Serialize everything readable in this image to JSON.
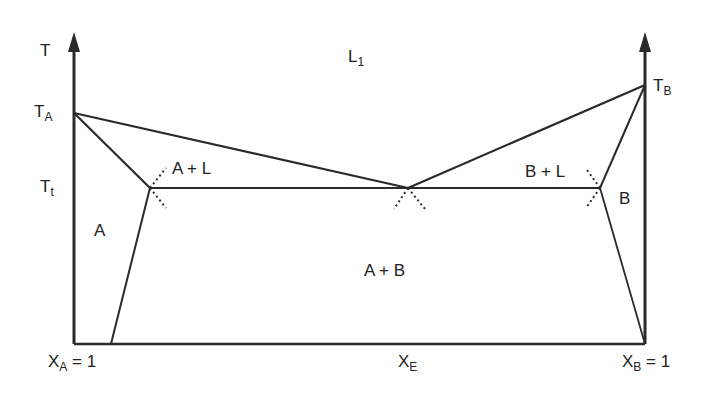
{
  "diagram": {
    "type": "binary eutectic phase diagram",
    "axis": {
      "y_label": "T",
      "x_left_label": "X",
      "x_left_sub": "A",
      "x_left_suffix": " = 1",
      "x_mid_label": "X",
      "x_mid_sub": "E",
      "x_right_label": "X",
      "x_right_sub": "B",
      "x_right_suffix": " = 1"
    },
    "temperatures": {
      "ta_main": "T",
      "ta_sub": "A",
      "tt_main": "T",
      "tt_sub": "t",
      "tb_main": "T",
      "tb_sub": "B"
    },
    "regions": {
      "liquid_main": "L",
      "liquid_sub": "1",
      "a_plus_l": "A + L",
      "b_plus_l": "B + L",
      "a_solid": "A",
      "b_solid": "B",
      "a_plus_b": "A + B"
    },
    "line_color": "#2a2a2a"
  }
}
